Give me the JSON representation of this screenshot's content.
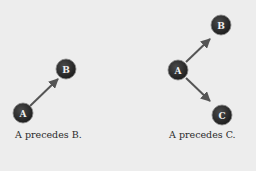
{
  "diagrams": [
    {
      "caption": "A precedes B.",
      "nodes": [
        {
          "id": "A",
          "label": "A"
        },
        {
          "id": "B",
          "label": "B"
        }
      ],
      "edges": [
        {
          "from": "A",
          "to": "B"
        }
      ]
    },
    {
      "caption": "A precedes C.",
      "nodes": [
        {
          "id": "A",
          "label": "A"
        },
        {
          "id": "B",
          "label": "B"
        },
        {
          "id": "C",
          "label": "C"
        }
      ],
      "edges": [
        {
          "from": "A",
          "to": "B"
        },
        {
          "from": "A",
          "to": "C"
        }
      ]
    }
  ],
  "colors": {
    "background": "#ededed",
    "node_fill": "#2b2b2b",
    "edge": "#555555",
    "label": "#f0f0f0"
  }
}
